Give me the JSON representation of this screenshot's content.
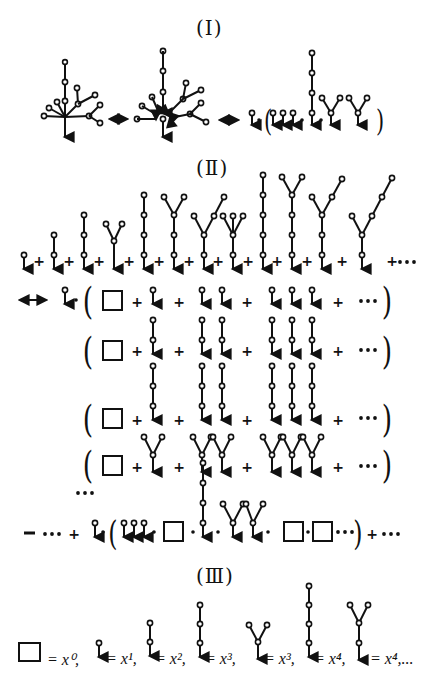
{
  "sections": {
    "I": {
      "title": "(Ⅰ)"
    },
    "II": {
      "title": "(Ⅱ)"
    },
    "III": {
      "title": "(Ⅲ)"
    }
  },
  "symbols": {
    "plus": "+",
    "dots": "•••",
    "equiv": "⟷",
    "mult_dot": "•",
    "lparen": "(",
    "rparen": ")",
    "minus": "−"
  },
  "legend": [
    {
      "shape": "empty-box",
      "text": "= x⁰,"
    },
    {
      "shape": "chain-1",
      "text": "= x¹,"
    },
    {
      "shape": "chain-2",
      "text": "= x²,"
    },
    {
      "shape": "chain-3",
      "text": "= x³,"
    },
    {
      "shape": "fork-2",
      "text": "= x³,"
    },
    {
      "shape": "chain-4",
      "text": "= x⁴,"
    },
    {
      "shape": "fork-chain",
      "text": "= x⁴,..."
    }
  ],
  "colors": {
    "ink": "#111111",
    "paper": "#ffffff"
  }
}
